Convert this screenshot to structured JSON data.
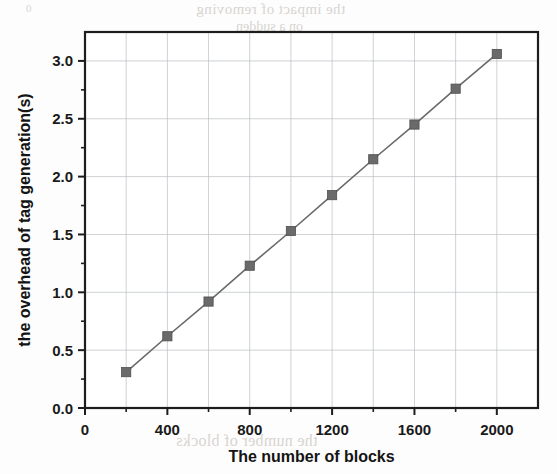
{
  "chart_data": {
    "type": "line",
    "title": "",
    "subtitle": "",
    "xlabel": "The number of blocks",
    "ylabel": "the overhead of tag generation(s)",
    "x": [
      200,
      400,
      600,
      800,
      1000,
      1200,
      1400,
      1600,
      1800,
      2000
    ],
    "values": [
      0.31,
      0.62,
      0.92,
      1.23,
      1.53,
      1.84,
      2.15,
      2.45,
      2.76,
      3.06
    ],
    "series": [
      {
        "name": "the overhead of tag generation(s)",
        "values": [
          0.31,
          0.62,
          0.92,
          1.23,
          1.53,
          1.84,
          2.15,
          2.45,
          2.76,
          3.06
        ]
      }
    ],
    "xlim": [
      0,
      2200
    ],
    "ylim": [
      0.0,
      3.25
    ],
    "xticks": [
      0,
      400,
      800,
      1200,
      1600,
      2000
    ],
    "xtick_labels": [
      "0",
      "400",
      "800",
      "1200",
      "1600",
      "2000"
    ],
    "xminor_step": 200,
    "yticks": [
      0.0,
      0.5,
      1.0,
      1.5,
      2.0,
      2.5,
      3.0
    ],
    "ytick_labels": [
      "0.0",
      "0.5",
      "1.0",
      "1.5",
      "2.0",
      "2.5",
      "3.0"
    ],
    "yminor_step": 0.25,
    "grid": true,
    "grid_color": "#b9bcc0",
    "legend": false,
    "legend_position": "none",
    "marker": "square",
    "marker_color": "#6a6a6a",
    "line_color": "#6a6a6a",
    "frame_color": "#1d1d1d"
  },
  "background_artifacts": {
    "note": "faint mirrored bleed-through text from reverse of scanned page",
    "lines": [
      "the impact of removing",
      "on a sudden",
      "2000",
      "1500",
      "1000",
      "0.8",
      "the number of blocks",
      "0"
    ]
  }
}
